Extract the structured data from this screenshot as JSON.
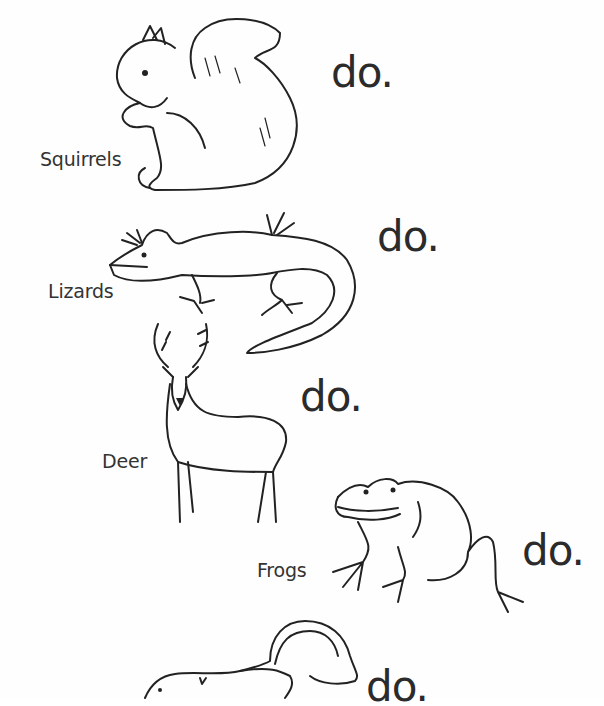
{
  "worksheet": {
    "rows": [
      {
        "animal": "Squirrels",
        "icon": "squirrel-icon",
        "ending": "do."
      },
      {
        "animal": "Lizards",
        "icon": "lizard-icon",
        "ending": "do."
      },
      {
        "animal": "Deer",
        "icon": "deer-icon",
        "ending": "do."
      },
      {
        "animal": "Frogs",
        "icon": "frog-icon",
        "ending": "do."
      },
      {
        "animal": "",
        "icon": "skunk-icon",
        "ending": "do."
      }
    ]
  }
}
